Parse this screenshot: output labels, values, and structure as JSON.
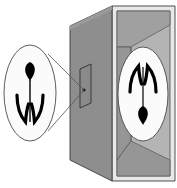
{
  "figure": {
    "caption": "",
    "background_color": "#ffffff",
    "ink_color": "#000000"
  },
  "colors": {
    "box_front_face": "#8e8e8e",
    "box_front_face_shade": "#9a9a9a",
    "box_interior_wall": "#a0a0a0",
    "box_interior_back": "#b4b4b4",
    "box_interior_floor": "#969696",
    "box_frame_light": "#e8e8e8",
    "box_frame_edge": "#5a5a5a",
    "outline": "#3c3c3c",
    "ray_line": "#555555",
    "ellipse_fill": "#fbfbfb",
    "ellipse_stroke": "#4a4a4a",
    "object_black": "#000000",
    "aperture_fill": "#8a8a8a",
    "aperture_stroke": "#2f2f2f"
  },
  "object_scene": {
    "label": "object-ellipse",
    "description": "Upright flower seen outside the camera",
    "orientation": "upright",
    "ellipse": {
      "cx": 30,
      "cy": 93,
      "rx": 26,
      "ry": 48
    },
    "flower": {
      "bud_label": "flower-bud",
      "stem_label": "flower-stem",
      "leaves_label": "flower-leaves",
      "bud_position": "top",
      "leaves_position": "bottom"
    }
  },
  "image_scene": {
    "label": "projected-image-ellipse",
    "description": "Inverted flower image projected on the back wall inside the box",
    "orientation": "inverted",
    "ellipse": {
      "cx": 143,
      "cy": 94,
      "rx": 25,
      "ry": 47
    },
    "flower": {
      "bud_label": "flower-bud",
      "stem_label": "flower-stem",
      "leaves_label": "flower-leaves",
      "bud_position": "bottom",
      "leaves_position": "top"
    }
  },
  "aperture": {
    "label": "pinhole-aperture",
    "shape": "vertical-slit",
    "x": 80,
    "y": 69,
    "width": 11,
    "height": 39,
    "convergence_point": {
      "x": 84,
      "y": 90
    }
  },
  "rays": [
    {
      "label": "upper-ray",
      "from": {
        "x": 48,
        "y": 54
      },
      "to": {
        "x": 84,
        "y": 90
      }
    },
    {
      "label": "lower-ray",
      "from": {
        "x": 48,
        "y": 131
      },
      "to": {
        "x": 84,
        "y": 90
      }
    }
  ],
  "box": {
    "label": "camera-obscura-box",
    "front_face": "shaded gray rectangle in perspective",
    "right_panel": "open side showing interior with image on back wall",
    "frame": "light outer frame around right panel"
  }
}
